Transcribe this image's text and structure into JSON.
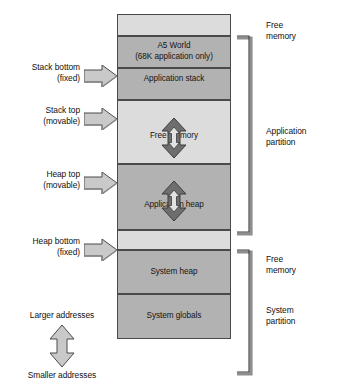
{
  "diagram": {
    "memory_blocks": [
      {
        "id": "free-memory-top",
        "label": "",
        "label2": "",
        "shade": "light",
        "top": 0,
        "height": 22
      },
      {
        "id": "a5-world",
        "label": "A5 World",
        "label2": "(68K application only)",
        "shade": "dark",
        "top": 22,
        "height": 32
      },
      {
        "id": "application-stack",
        "label": "Application stack",
        "label2": "",
        "shade": "dark",
        "top": 54,
        "height": 32
      },
      {
        "id": "free-memory-middle",
        "label": "Free memory",
        "label2": "",
        "shade": "light",
        "top": 86,
        "height": 64
      },
      {
        "id": "application-heap",
        "label": "Application heap",
        "label2": "",
        "shade": "dark",
        "top": 150,
        "height": 66
      },
      {
        "id": "free-memory-lower",
        "label": "",
        "label2": "",
        "shade": "light",
        "top": 216,
        "height": 20
      },
      {
        "id": "system-heap",
        "label": "System heap",
        "label2": "",
        "shade": "dark",
        "top": 236,
        "height": 44
      },
      {
        "id": "system-globals",
        "label": "System globals",
        "label2": "",
        "shade": "dark",
        "top": 280,
        "height": 45
      }
    ],
    "pointer_labels": [
      {
        "id": "stack-bottom",
        "line1": "Stack bottom",
        "line2": "(fixed)"
      },
      {
        "id": "stack-top",
        "line1": "Stack top",
        "line2": "(movable)"
      },
      {
        "id": "heap-top",
        "line1": "Heap top",
        "line2": "(movable)"
      },
      {
        "id": "heap-bottom",
        "line1": "Heap bottom",
        "line2": "(fixed)"
      }
    ],
    "right_labels": [
      {
        "id": "free-memory-top-label",
        "line1": "Free",
        "line2": "memory"
      },
      {
        "id": "application-partition",
        "line1": "Application",
        "line2": "partition"
      },
      {
        "id": "free-memory-lower-label",
        "line1": "Free",
        "line2": "memory"
      },
      {
        "id": "system-partition",
        "line1": "System",
        "line2": "partition"
      }
    ],
    "address_direction": {
      "larger": "Larger addresses",
      "smaller": "Smaller addresses"
    },
    "colors": {
      "dark_block": "#b2b2b2",
      "light_block": "#dcdcdc",
      "outline": "#4a4a4a",
      "arrow_fill": "#c4c4c4",
      "arrow_dark": "#6e6e6e",
      "text": "#101010",
      "background": "#ffffff"
    }
  }
}
